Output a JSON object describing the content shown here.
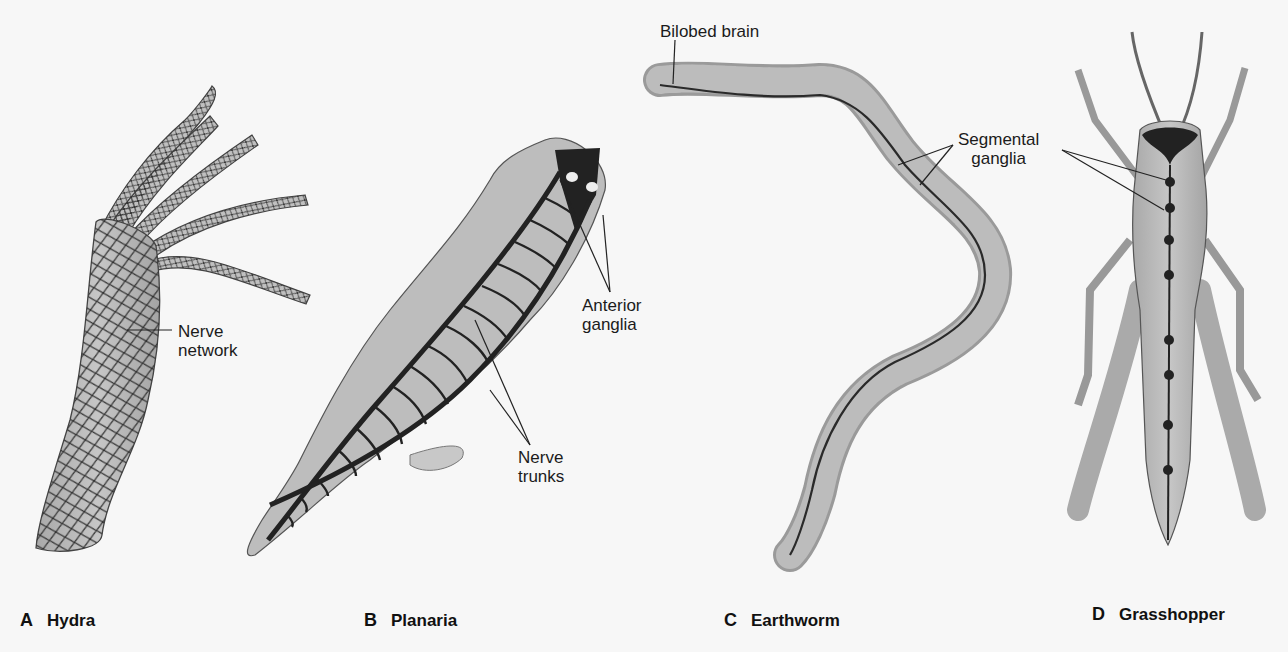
{
  "figure": {
    "panels": [
      {
        "letter": "A",
        "organism": "Hydra",
        "labels": [
          {
            "line1": "Nerve",
            "line2": "network"
          }
        ]
      },
      {
        "letter": "B",
        "organism": "Planaria",
        "labels": [
          {
            "line1": "Anterior",
            "line2": "ganglia"
          },
          {
            "line1": "Nerve",
            "line2": "trunks"
          }
        ]
      },
      {
        "letter": "C",
        "organism": "Earthworm",
        "labels": [
          {
            "line1": "Bilobed brain"
          },
          {
            "line1": "Segmental",
            "line2": "ganglia"
          }
        ]
      },
      {
        "letter": "D",
        "organism": "Grasshopper",
        "labels": []
      }
    ]
  },
  "colors": {
    "background": "#f7f7f7",
    "body_fill": "#b9b9b9",
    "nerve": "#2a2a2a",
    "text": "#1b1b1b"
  }
}
